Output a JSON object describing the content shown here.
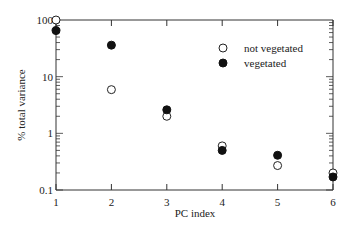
{
  "chart_data": {
    "type": "scatter",
    "title": "",
    "xlabel": "PC index",
    "ylabel": "% total variance",
    "x": [
      1,
      2,
      3,
      4,
      5,
      6
    ],
    "xticks": [
      "1",
      "2",
      "3",
      "4",
      "5",
      "6"
    ],
    "yticks": [
      "0.1",
      "1",
      "10",
      "100"
    ],
    "yscale": "log",
    "xlim": [
      1,
      6
    ],
    "ylim": [
      0.1,
      100
    ],
    "grid": false,
    "legend_position": "upper right",
    "series": [
      {
        "name": "not vegetated",
        "marker": "open-circle",
        "values": [
          100,
          5.9,
          2.0,
          0.6,
          0.27,
          0.2
        ]
      },
      {
        "name": "vegetated",
        "marker": "filled-circle",
        "values": [
          65,
          36,
          2.6,
          0.5,
          0.41,
          0.17
        ]
      }
    ]
  },
  "legend": {
    "items": [
      {
        "label": "not vegetated"
      },
      {
        "label": "vegetated"
      }
    ]
  }
}
